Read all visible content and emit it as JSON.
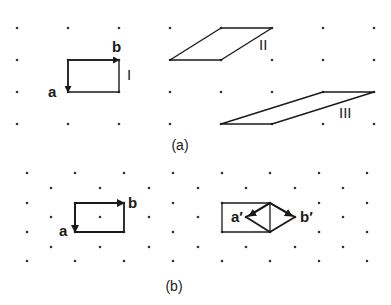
{
  "figure": {
    "panel_a": {
      "caption": "(a)",
      "grid": {
        "xs": [
          17,
          68,
          119,
          170,
          221,
          272,
          323,
          374
        ],
        "ys": [
          28,
          60,
          92,
          124
        ]
      },
      "cells": [
        {
          "id": "I",
          "label": "I",
          "points": [
            [
              68,
              60
            ],
            [
              119,
              60
            ],
            [
              119,
              92
            ],
            [
              68,
              92
            ]
          ],
          "label_pos": [
            127,
            80
          ]
        },
        {
          "id": "II",
          "label": "II",
          "points": [
            [
              170,
              60
            ],
            [
              221,
              28
            ],
            [
              272,
              28
            ],
            [
              221,
              60
            ]
          ],
          "label_pos": [
            259,
            50
          ]
        },
        {
          "id": "III",
          "label": "III",
          "points": [
            [
              221,
              124
            ],
            [
              323,
              92
            ],
            [
              374,
              92
            ],
            [
              272,
              124
            ]
          ],
          "label_pos": [
            339,
            118
          ]
        }
      ],
      "vectors": [
        {
          "name": "b",
          "label": "b",
          "from": [
            68,
            60
          ],
          "to": [
            119,
            60
          ],
          "label_pos": [
            112,
            52
          ]
        },
        {
          "name": "a",
          "label": "a",
          "from": [
            68,
            60
          ],
          "to": [
            68,
            92
          ],
          "label_pos": [
            48,
            97
          ]
        }
      ]
    },
    "panel_b": {
      "caption": "(b)",
      "grid": {
        "rows_even": {
          "ys": [
            173,
            203,
            232,
            261
          ],
          "xs": [
            27,
            75,
            124,
            173,
            222,
            270,
            319,
            367
          ]
        },
        "rows_odd": {
          "ys": [
            188,
            217,
            247
          ],
          "xs": [
            51,
            100,
            149,
            198,
            246,
            295,
            343
          ]
        }
      },
      "left_cell": {
        "points": [
          [
            75,
            203
          ],
          [
            124,
            203
          ],
          [
            124,
            232
          ],
          [
            75,
            232
          ]
        ]
      },
      "left_vectors": [
        {
          "name": "b",
          "label": "b",
          "from": [
            75,
            203
          ],
          "to": [
            124,
            203
          ],
          "label_pos": [
            128,
            208
          ]
        },
        {
          "name": "a",
          "label": "a",
          "from": [
            75,
            203
          ],
          "to": [
            75,
            232
          ],
          "label_pos": [
            59,
            236
          ]
        }
      ],
      "right_cell": {
        "points": [
          [
            222,
            203
          ],
          [
            270,
            203
          ],
          [
            270,
            232
          ],
          [
            222,
            232
          ]
        ]
      },
      "right_diamond": {
        "points": [
          [
            270,
            203
          ],
          [
            295,
            217
          ],
          [
            270,
            232
          ],
          [
            246,
            217
          ]
        ]
      },
      "right_vectors": [
        {
          "name": "a-prime",
          "label": "a′",
          "from": [
            270,
            203
          ],
          "to": [
            249,
            216
          ],
          "label_pos": [
            231,
            222
          ]
        },
        {
          "name": "b-prime",
          "label": "b′",
          "from": [
            270,
            203
          ],
          "to": [
            292,
            216
          ],
          "label_pos": [
            300,
            222
          ]
        }
      ]
    }
  },
  "colors": {
    "line": "#1a1a1a",
    "dot": "#333333",
    "background": "#ffffff"
  }
}
